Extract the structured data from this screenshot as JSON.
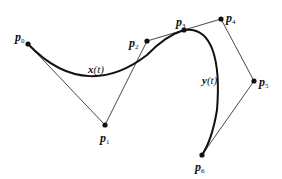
{
  "diagram": {
    "type": "bezier-spline",
    "control_points": [
      {
        "id": "p0",
        "name": "p",
        "sub": "0",
        "x": 28,
        "y": 44,
        "label_x": 15,
        "label_y": 41
      },
      {
        "id": "p1",
        "name": "p",
        "sub": "1",
        "x": 105,
        "y": 125,
        "label_x": 100,
        "label_y": 142
      },
      {
        "id": "p2",
        "name": "p",
        "sub": "2",
        "x": 147,
        "y": 41,
        "label_x": 129,
        "label_y": 47
      },
      {
        "id": "p3",
        "name": "p",
        "sub": "3",
        "x": 184,
        "y": 30,
        "label_x": 176,
        "label_y": 26
      },
      {
        "id": "p4",
        "name": "p",
        "sub": "4",
        "x": 221,
        "y": 19,
        "label_x": 226,
        "label_y": 22
      },
      {
        "id": "p5",
        "name": "p",
        "sub": "5",
        "x": 254,
        "y": 81,
        "label_x": 259,
        "label_y": 86
      },
      {
        "id": "p6",
        "name": "p",
        "sub": "6",
        "x": 202,
        "y": 155,
        "label_x": 195,
        "label_y": 171
      }
    ],
    "curves": [
      {
        "id": "x",
        "var": "x",
        "arg": "(t)",
        "label_x": 88,
        "label_y": 73
      },
      {
        "id": "y",
        "var": "y",
        "arg": "(t)",
        "label_x": 202,
        "label_y": 84
      }
    ]
  }
}
